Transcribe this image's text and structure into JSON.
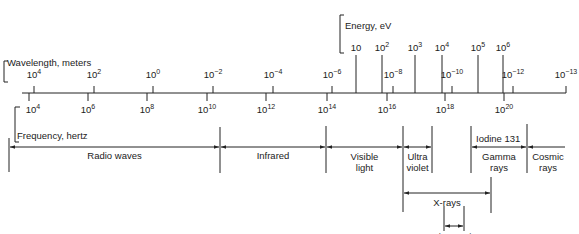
{
  "chart_data": {
    "type": "diagram",
    "axes": {
      "wavelength": {
        "label": "Wavelength, meters",
        "ticks": [
          {
            "base": "10",
            "exp": "4",
            "x": 34
          },
          {
            "base": "10",
            "exp": "2",
            "x": 94
          },
          {
            "base": "10",
            "exp": "0",
            "x": 153
          },
          {
            "base": "10",
            "exp": "−2",
            "x": 213
          },
          {
            "base": "10",
            "exp": "−4",
            "x": 273
          },
          {
            "base": "10",
            "exp": "−6",
            "x": 332
          },
          {
            "base": "10",
            "exp": "−8",
            "x": 393
          },
          {
            "base": "10",
            "exp": "−10",
            "x": 452
          },
          {
            "base": "10",
            "exp": "−12",
            "x": 513
          },
          {
            "base": "10",
            "exp": "−13",
            "x": 566
          }
        ]
      },
      "frequency": {
        "label": "Frequency, hertz",
        "ticks": [
          {
            "base": "10",
            "exp": "4",
            "x": 29
          },
          {
            "base": "10",
            "exp": "6",
            "x": 88
          },
          {
            "base": "10",
            "exp": "8",
            "x": 147
          },
          {
            "base": "10",
            "exp": "10",
            "x": 207
          },
          {
            "base": "10",
            "exp": "12",
            "x": 266
          },
          {
            "base": "10",
            "exp": "14",
            "x": 327
          },
          {
            "base": "10",
            "exp": "16",
            "x": 387
          },
          {
            "base": "10",
            "exp": "18",
            "x": 445
          },
          {
            "base": "10",
            "exp": "20",
            "x": 504
          }
        ]
      },
      "energy": {
        "label": "Energy, eV",
        "ticks": [
          {
            "base": "10",
            "exp": "",
            "x": 356
          },
          {
            "base": "10",
            "exp": "2",
            "x": 382
          },
          {
            "base": "10",
            "exp": "3",
            "x": 415
          },
          {
            "base": "10",
            "exp": "4",
            "x": 442
          },
          {
            "base": "10",
            "exp": "5",
            "x": 478
          },
          {
            "base": "10",
            "exp": "6",
            "x": 503
          }
        ]
      }
    },
    "bands": [
      {
        "name": "Radio waves",
        "line1": "Radio waves",
        "line2": "",
        "x1": 9,
        "x2": 220
      },
      {
        "name": "Infrared",
        "line1": "Infrared",
        "line2": "",
        "x1": 220,
        "x2": 326
      },
      {
        "name": "Visible light",
        "line1": "Visible",
        "line2": "light",
        "x1": 326,
        "x2": 403
      },
      {
        "name": "Ultra violet",
        "line1": "Ultra",
        "line2": "violet",
        "x1": 403,
        "x2": 432
      },
      {
        "name": "Gamma rays",
        "line1": "Gamma",
        "line2": "rays",
        "x1": 471,
        "x2": 527
      },
      {
        "name": "Cosmic rays",
        "line1": "Cosmic",
        "line2": "rays",
        "x1": 527,
        "x2": 565
      }
    ],
    "annotations": {
      "iodine": "Iodine  131",
      "xrays": {
        "label": "X-rays",
        "x1": 403,
        "x2": 491
      },
      "diagnostic": {
        "line1": "Diagnostic",
        "line2": "X-rays",
        "x1": 444,
        "x2": 464
      }
    }
  }
}
